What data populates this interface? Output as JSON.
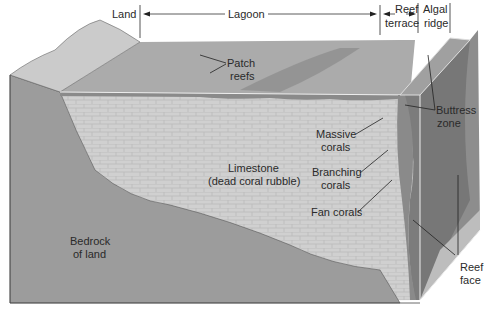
{
  "zones": {
    "land": "Land",
    "lagoon": "Lagoon",
    "reef_terrace_1": "Reef",
    "reef_terrace_2": "terrace",
    "algal_ridge_1": "Algal",
    "algal_ridge_2": "ridge"
  },
  "labels": {
    "patch_reefs_1": "Patch",
    "patch_reefs_2": "reefs",
    "buttress_1": "Buttress",
    "buttress_2": "zone",
    "massive_1": "Massive",
    "massive_2": "corals",
    "branching_1": "Branching",
    "branching_2": "corals",
    "fan": "Fan corals",
    "limestone_1": "Limestone",
    "limestone_2": "(dead coral rubble)",
    "bedrock_1": "Bedrock",
    "bedrock_2": "of land",
    "reef_face_1": "Reef",
    "reef_face_2": "face"
  },
  "colors": {
    "bedrock": "#9a9a9a",
    "limestone": "#cfcfcf",
    "lagoon": "#a9a9a9",
    "land": "#c8c8c8",
    "reef": "#7d7d7d",
    "reef_side": "#8e8e8e"
  }
}
